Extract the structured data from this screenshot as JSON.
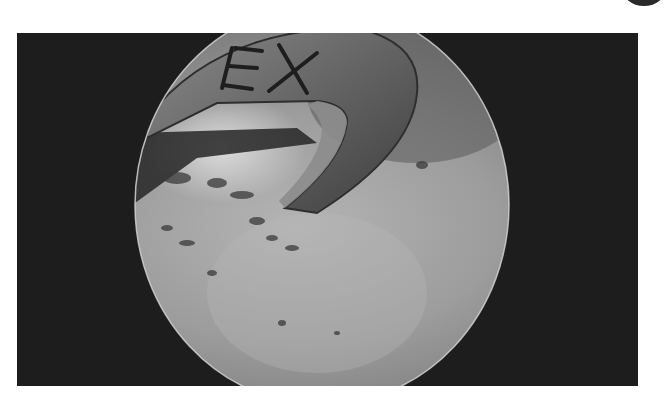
{
  "image": {
    "kind": "arthroscopic-view",
    "alt": "Arthroscopic view of a joint with a curved metal instrument engraved with letters",
    "instrument_label": "EX",
    "colors": {
      "page_background": "#ffffff",
      "frame_background": "#1d1d1d",
      "tissue_base": "#9a9a9a",
      "tissue_light": "#c8c8c8",
      "instrument_metal": "#6e6e6e",
      "scope_rim": "#d0d0d0"
    }
  }
}
